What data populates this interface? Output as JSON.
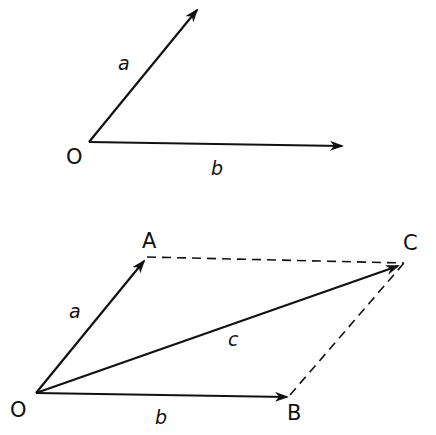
{
  "figure1": {
    "origin_label": "O",
    "vector_a_label": "a",
    "vector_b_label": "b"
  },
  "figure2": {
    "origin_label": "O",
    "point_a_label": "A",
    "point_b_label": "B",
    "point_c_label": "C",
    "vector_a_label": "a",
    "vector_b_label": "b",
    "vector_c_label": "c"
  },
  "colors": {
    "stroke": "#111111",
    "background": "#ffffff"
  }
}
